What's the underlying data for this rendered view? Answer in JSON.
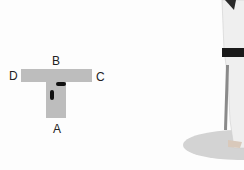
{
  "diagram": {
    "type": "stance-diagram",
    "shape": "T",
    "labels": {
      "top": "B",
      "left": "D",
      "right": "C",
      "bottom": "A"
    },
    "bar_color": "#bdbdbd",
    "footprint_color": "#111111"
  },
  "photo": {
    "subject": "martial-artist-legs",
    "belt_color": "#1a1a1a",
    "uniform_color": "#f0f0f0",
    "shadow_color": "#d3d3d3"
  }
}
